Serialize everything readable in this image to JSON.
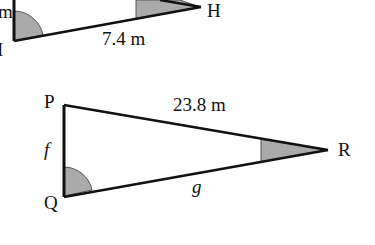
{
  "triangle_top": {
    "vertices": {
      "I": "I",
      "H": "H"
    },
    "partial_label": "m",
    "side_IH": "7.4 m"
  },
  "triangle_bottom": {
    "vertices": {
      "P": "P",
      "Q": "Q",
      "R": "R"
    },
    "side_PR": "23.8 m",
    "side_PQ": "f",
    "side_QR": "g"
  },
  "colors": {
    "line": "#111111",
    "shade": "#aaaaaa"
  }
}
